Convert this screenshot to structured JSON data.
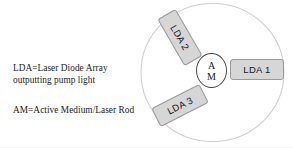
{
  "figure": {
    "background_color": "#ffffff"
  },
  "legend": {
    "lda_line1": "LDA=Laser Diode Array",
    "lda_line2": "outputting pump light",
    "am_line1": "AM=Active Medium/Laser Rod"
  },
  "diagram": {
    "outer_circle": {
      "name": "pump-chamber-circle",
      "stroke_color": "#cfcfcf",
      "fill_color": "#ffffff"
    },
    "active_medium": {
      "label_line1": "A",
      "label_line2": "M",
      "stroke_color": "#4a4a4a",
      "fill_color": "#ffffff"
    },
    "arrays": [
      {
        "id": "lda-1",
        "label": "LDA 1",
        "rotation_deg": 0,
        "fill_color": "#d6d6d6",
        "stroke_color": "#9a9a9a"
      },
      {
        "id": "lda-2",
        "label": "LDA 2",
        "rotation_deg": 60,
        "fill_color": "#d6d6d6",
        "stroke_color": "#9a9a9a"
      },
      {
        "id": "lda-3",
        "label": "LDA 3",
        "rotation_deg": -27,
        "fill_color": "#d6d6d6",
        "stroke_color": "#9a9a9a"
      }
    ]
  }
}
